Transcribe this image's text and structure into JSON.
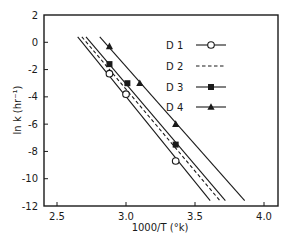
{
  "chart_data": {
    "type": "line",
    "title": "",
    "xlabel": "1000/T (°k)",
    "ylabel": "ln k (hr⁻¹)",
    "xlim": [
      2.35,
      4.1
    ],
    "ylim": [
      -12,
      2
    ],
    "xticks": [
      2.5,
      3.0,
      3.5,
      4.0
    ],
    "xtick_labels": [
      "2.5",
      "3.0",
      "3.5",
      "4.0"
    ],
    "yticks": [
      2,
      0,
      -2,
      -4,
      -6,
      -8,
      -10,
      -12
    ],
    "ytick_labels": [
      "2",
      "0",
      "-2",
      "-4",
      "-6",
      "-8",
      "-10",
      "-12"
    ],
    "grid": false,
    "legend_position": "upper right",
    "series": [
      {
        "name": "D 1",
        "marker": "open-circle",
        "line_style": "solid",
        "fit_line": [
          [
            2.65,
            0.4
          ],
          [
            3.61,
            -11.6
          ]
        ],
        "points": [
          [
            2.88,
            -2.3
          ],
          [
            3.0,
            -3.8
          ],
          [
            3.36,
            -8.7
          ]
        ]
      },
      {
        "name": "D 2",
        "marker": "none",
        "line_style": "dashed",
        "fit_line": [
          [
            2.68,
            0.4
          ],
          [
            3.68,
            -11.6
          ]
        ],
        "points": []
      },
      {
        "name": "D 3",
        "marker": "filled-square",
        "line_style": "solid",
        "fit_line": [
          [
            2.71,
            0.4
          ],
          [
            3.72,
            -11.6
          ]
        ],
        "points": [
          [
            2.88,
            -1.6
          ],
          [
            3.01,
            -3.0
          ],
          [
            3.36,
            -7.5
          ]
        ]
      },
      {
        "name": "D 4",
        "marker": "filled-triangle",
        "line_style": "solid",
        "fit_line": [
          [
            2.81,
            0.4
          ],
          [
            3.86,
            -11.6
          ]
        ],
        "points": [
          [
            2.88,
            -0.3
          ],
          [
            3.1,
            -3.0
          ],
          [
            3.36,
            -6.0
          ]
        ]
      }
    ]
  },
  "colors": {
    "ink": "#1a1a1a",
    "background": "#ffffff"
  }
}
